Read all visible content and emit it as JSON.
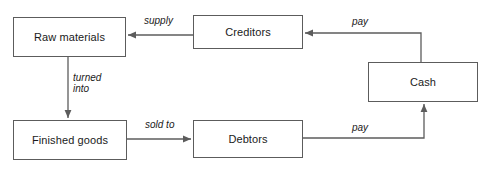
{
  "diagram": {
    "type": "flow-diagram",
    "background_color": "#ffffff",
    "stroke_color": "#5c5c5c",
    "text_color": "#1a1a1a",
    "nodes": [
      {
        "id": "raw-materials",
        "label": "Raw materials"
      },
      {
        "id": "creditors",
        "label": "Creditors"
      },
      {
        "id": "cash",
        "label": "Cash"
      },
      {
        "id": "finished-goods",
        "label": "Finished goods"
      },
      {
        "id": "debtors",
        "label": "Debtors"
      }
    ],
    "edges": [
      {
        "id": "supply",
        "label": "supply",
        "from": "creditors",
        "to": "raw-materials",
        "direction": "left"
      },
      {
        "id": "turned-into",
        "label": "turned\ninto",
        "from": "raw-materials",
        "to": "finished-goods",
        "direction": "down"
      },
      {
        "id": "pay-top",
        "label": "pay",
        "from": "cash",
        "to": "creditors",
        "direction": "left"
      },
      {
        "id": "sold-to",
        "label": "sold to",
        "from": "finished-goods",
        "to": "debtors",
        "direction": "right"
      },
      {
        "id": "pay-bottom",
        "label": "pay",
        "from": "debtors",
        "to": "cash",
        "direction": "up"
      }
    ]
  }
}
